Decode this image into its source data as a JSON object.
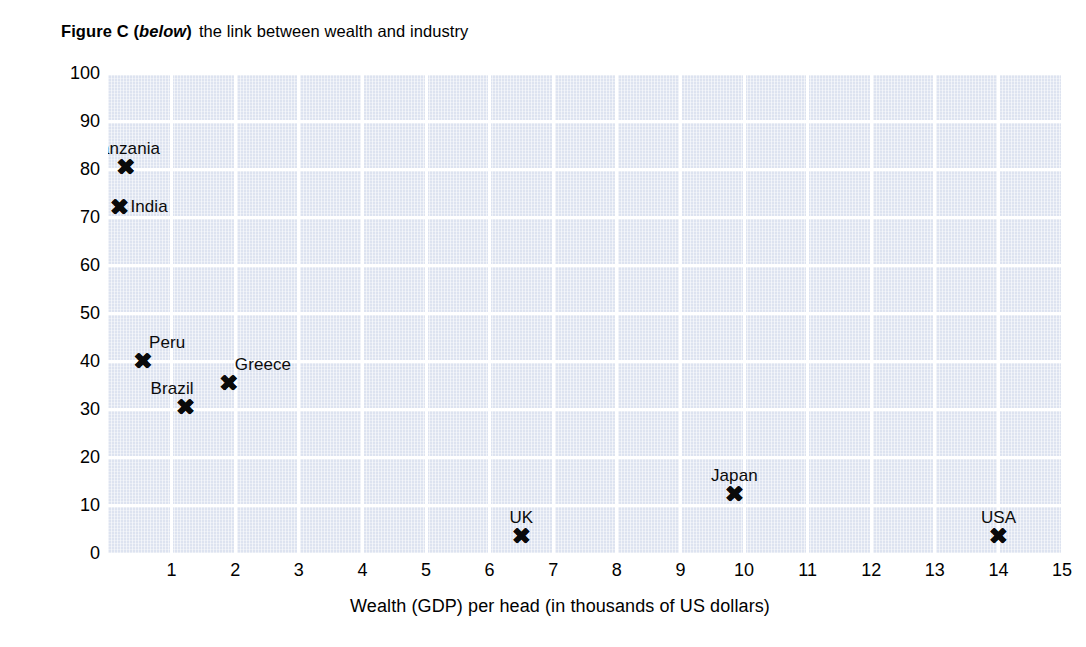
{
  "title": {
    "prefix_bold": "Figure C (",
    "emphasis": "below",
    "suffix_bold": ")",
    "rest": "the link between wealth and industry"
  },
  "chart_data": {
    "type": "scatter",
    "xlabel": "Wealth (GDP) per head (in thousands of US dollars)",
    "ylabel": "Percentage employed in primary industry",
    "xlim": [
      0,
      15
    ],
    "ylim": [
      0,
      100
    ],
    "xticks": [
      "0",
      "1",
      "2",
      "3",
      "4",
      "5",
      "6",
      "7",
      "8",
      "9",
      "10",
      "11",
      "12",
      "13",
      "14",
      "15"
    ],
    "yticks": [
      "0",
      "10",
      "20",
      "30",
      "40",
      "50",
      "60",
      "70",
      "80",
      "90",
      "100"
    ],
    "grid": true,
    "grid_color": "#ffffff",
    "plot_background": "#dde3f0",
    "marker_color": "#0a0a0a",
    "marker_symbol": "x-cross",
    "legend": "none",
    "points": [
      {
        "label": "Tanzania",
        "x": 0.28,
        "y": 80.5,
        "label_pos": "above"
      },
      {
        "label": "India",
        "x": 0.18,
        "y": 72.0,
        "label_pos": "right"
      },
      {
        "label": "Peru",
        "x": 0.55,
        "y": 40.0,
        "label_pos": "above-right"
      },
      {
        "label": "Greece",
        "x": 1.9,
        "y": 35.5,
        "label_pos": "above-right"
      },
      {
        "label": "Brazil",
        "x": 1.22,
        "y": 30.5,
        "label_pos": "above-left"
      },
      {
        "label": "Japan",
        "x": 9.85,
        "y": 12.3,
        "label_pos": "above"
      },
      {
        "label": "UK",
        "x": 6.5,
        "y": 3.5,
        "label_pos": "above"
      },
      {
        "label": "USA",
        "x": 14.0,
        "y": 3.5,
        "label_pos": "above"
      }
    ]
  }
}
